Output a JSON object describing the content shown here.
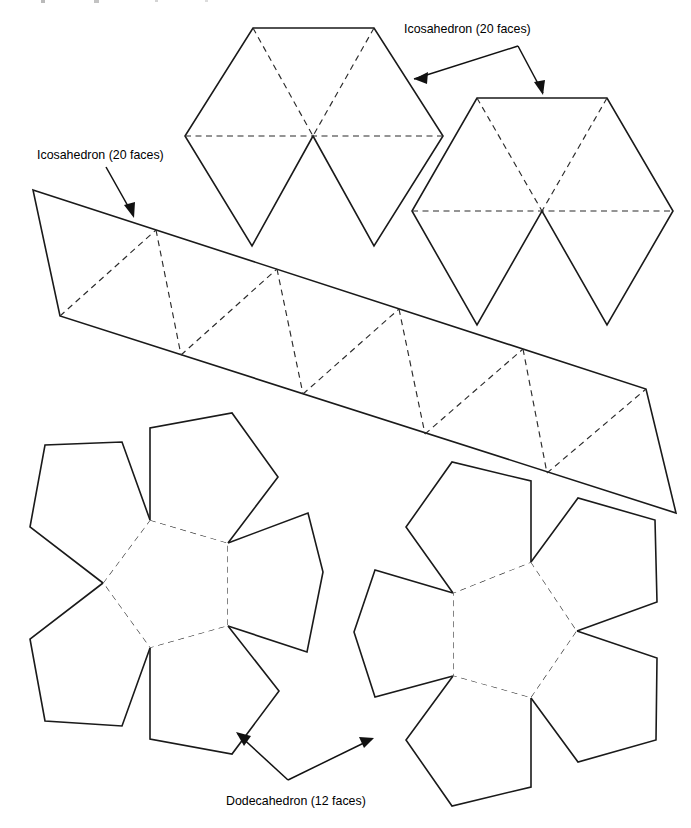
{
  "figure": {
    "background_color": "#ffffff",
    "cut_edge_color": "#1a1a1a",
    "fold_edge_color": "#2b2b2b",
    "text_color": "#000000",
    "width": 691,
    "height": 828
  },
  "annotations": [
    {
      "id": "icosahedron-top",
      "label": "Icosahedron (20 faces)",
      "text_x": 404,
      "text_y": 33,
      "pointer_count": 2
    },
    {
      "id": "icosahedron-strip",
      "label": "Icosahedron (20 faces)",
      "text_x": 37,
      "text_y": 159,
      "pointer_count": 1
    },
    {
      "id": "dodecahedron-bottom",
      "label": "Dodecahedron (12 faces)",
      "text_x": 226,
      "text_y": 805,
      "pointer_count": 2
    }
  ],
  "shapes": {
    "icosahedron_cap_left": {
      "name": "Icosahedron cap net (6 triangles)",
      "solid_faces": 6,
      "center": [
        313,
        136
      ],
      "outline": "253,28 374,28 443,136 374,246 313,136 252,246 185,136",
      "fold_lines": [
        "253,28 313,136",
        "374,28 313,136",
        "185,136 443,136"
      ]
    },
    "icosahedron_cap_right": {
      "name": "Icosahedron cap net (6 triangles)",
      "solid_faces": 6,
      "center": [
        542,
        211
      ],
      "outline": "477,98 607,98 673,211 607,325 542,211 477,325 412,211",
      "fold_lines": [
        "477,98 542,211",
        "607,98 542,211",
        "412,211 673,211"
      ]
    },
    "icosahedron_band": {
      "name": "Icosahedron antiprism band (10 triangles)",
      "solid_faces": 10,
      "top_vertices": [
        [
          33,
          190
        ],
        [
          156,
          230
        ],
        [
          277,
          269
        ],
        [
          399,
          309
        ],
        [
          523,
          349
        ],
        [
          646,
          389
        ]
      ],
      "bottom_vertices": [
        [
          60,
          316
        ],
        [
          181,
          355
        ],
        [
          303,
          394
        ],
        [
          425,
          434
        ],
        [
          547,
          473
        ],
        [
          676,
          513
        ]
      ],
      "zigzag_folds": 9
    },
    "dodecahedron_left": {
      "name": "Dodecahedron net half (6 pentagons)",
      "solid_faces": 5,
      "hidden_faces": 1,
      "center_pentagon": "150,520 228,543 228,626 150,648 103,583"
    },
    "dodecahedron_right": {
      "name": "Dodecahedron net half (6 pentagons)",
      "solid_faces": 5,
      "hidden_faces": 1,
      "center_pentagon": "531,562 577,631 531,698 453,676 453,593"
    }
  }
}
